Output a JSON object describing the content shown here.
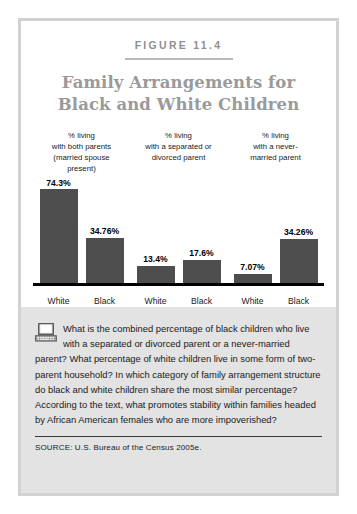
{
  "figure": {
    "label": "FIGURE 11.4",
    "title_line1": "Family Arrangements for",
    "title_line2": "Black and White Children"
  },
  "chart_data": {
    "type": "bar",
    "title": "Family Arrangements for Black and White Children",
    "xlabel": "",
    "ylabel": "",
    "ylim": [
      0,
      80
    ],
    "grid": false,
    "legend": "none",
    "group_headers": [
      "% living\nwith both parents\n(married spouse\npresent)",
      "% living\nwith a separated or\ndivorced parent",
      "% living\nwith a never-\nmarried parent"
    ],
    "groups": [
      {
        "header_lines": [
          "% living",
          "with both parents",
          "(married spouse",
          "present)"
        ],
        "bars": [
          {
            "category": "White",
            "value": 74.3,
            "label": "74.3%"
          },
          {
            "category": "Black",
            "value": 34.76,
            "label": "34.76%"
          }
        ]
      },
      {
        "header_lines": [
          "% living",
          "with a separated or",
          "divorced parent"
        ],
        "bars": [
          {
            "category": "White",
            "value": 13.4,
            "label": "13.4%"
          },
          {
            "category": "Black",
            "value": 17.6,
            "label": "17.6%"
          }
        ]
      },
      {
        "header_lines": [
          "% living",
          "with a never-",
          "married parent"
        ],
        "bars": [
          {
            "category": "White",
            "value": 7.07,
            "label": "7.07%"
          },
          {
            "category": "Black",
            "value": 34.26,
            "label": "34.26%"
          }
        ]
      }
    ],
    "categories": [
      "White",
      "Black",
      "White",
      "Black",
      "White",
      "Black"
    ],
    "values": [
      74.3,
      34.76,
      13.4,
      17.6,
      7.07,
      34.26
    ],
    "bar_color": "#4e4e4e"
  },
  "question": {
    "icon": "computer-icon",
    "text": "What is the combined percentage of black children who live with a separated or divorced parent or a never-married parent? What percentage of white children live in some form of two-parent household? In which category of family arrangement structure do black and white children share the most similar percentage? According to the text, what promotes stability within families headed by African American females who are more impoverished?"
  },
  "source": {
    "text": "SOURCE: U.S. Bureau of the Census 2005e."
  },
  "colors": {
    "bar": "#4e4e4e",
    "title": "#9a9a9a",
    "frame": "#d2d2d2",
    "panel_bg": "#e3e3e3",
    "axis": "#000000"
  }
}
